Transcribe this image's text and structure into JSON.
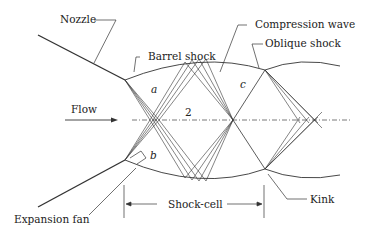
{
  "diagram": {
    "labels": {
      "nozzle": "Nozzle",
      "barrel_shock": "Barrel shock",
      "compression_wave": "Compression wave",
      "oblique_shock": "Oblique shock",
      "flow": "Flow",
      "region_a": "a",
      "region_2": "2",
      "region_c": "c",
      "region_b": "b",
      "expansion_fan": "Expansion fan",
      "shock_cell": "Shock-cell",
      "kink": "Kink"
    },
    "colors": {
      "line": "#333333",
      "background": "#ffffff"
    }
  }
}
